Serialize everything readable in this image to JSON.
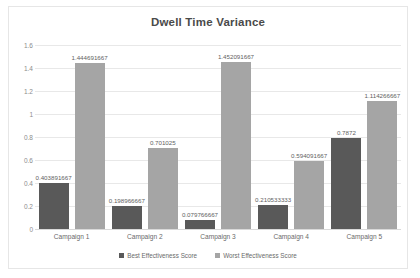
{
  "chart_data": {
    "type": "bar",
    "title": "Dwell Time Variance",
    "xlabel": "",
    "ylabel": "",
    "ylim": [
      0,
      1.6
    ],
    "yticks": [
      "0",
      "0.2",
      "0.4",
      "0.6",
      "0.8",
      "1",
      "1.2",
      "1.4",
      "1.6"
    ],
    "grid": true,
    "legend_position": "bottom-center",
    "categories": [
      "Campaign 1",
      "Campaign 2",
      "Campaign 3",
      "Campaign 4",
      "Campaign 5"
    ],
    "series": [
      {
        "name": "Best Effectiveness Score",
        "color": "#595959",
        "values": [
          0.403891667,
          0.198966667,
          0.079766667,
          0.210533333,
          0.7872
        ],
        "labels": [
          "0.403891667",
          "0.198966667",
          "0.079766667",
          "0.210533333",
          "0.7872"
        ]
      },
      {
        "name": "Worst Effectiveness Score",
        "color": "#a5a5a5",
        "values": [
          1.444691667,
          0.701025,
          1.452091667,
          0.594091667,
          1.114266667
        ],
        "labels": [
          "1.444691667",
          "0.701025",
          "1.452091667",
          "0.594091667",
          "1.114266667"
        ]
      }
    ]
  }
}
